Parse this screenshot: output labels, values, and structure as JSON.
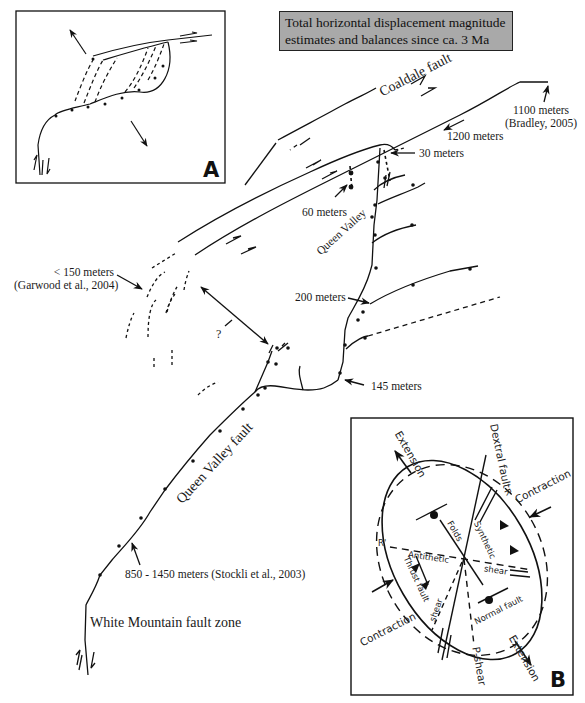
{
  "title": {
    "line1": "Total horizontal displacement magnitude",
    "line2": "estimates and balances since ca. 3 Ma"
  },
  "faults": {
    "coaldale": "Coaldale fault",
    "queen_valley_fault": "Queen Valley fault",
    "queen_valley": "Queen Valley",
    "white_mountain": "White Mountain fault zone"
  },
  "estimates": [
    {
      "value": "1100 meters",
      "source": "(Bradley, 2005)"
    },
    {
      "value": "1200 meters"
    },
    {
      "value": "30 meters"
    },
    {
      "value": "60 meters"
    },
    {
      "value": "< 150 meters",
      "source": "(Garwood et al., 2004)"
    },
    {
      "value": "200 meters"
    },
    {
      "value": "145 meters"
    },
    {
      "value": "850 - 1450 meters (Stockli et al., 2003)"
    }
  ],
  "unknown_marker": "?",
  "panel_a": {
    "letter": "A"
  },
  "panel_b": {
    "letter": "B",
    "labels": {
      "extension_top": "Extension",
      "extension_bottom": "Extension",
      "contraction_right": "Contraction",
      "contraction_left": "Contraction",
      "dextral_fault": "Dextral fault",
      "r": "R",
      "r_prime": "R'",
      "folds": "Folds",
      "synthetic": "Synthetic",
      "antithetic": "Antithetic",
      "shear": "shear",
      "thrust_fault": "Thrust fault",
      "shear_lower": "shear",
      "normal_fault": "Normal fault",
      "p_shear": "P-shear"
    }
  },
  "colors": {
    "line": "#111111",
    "title_box": "#a9a9a9",
    "background": "#ffffff"
  }
}
